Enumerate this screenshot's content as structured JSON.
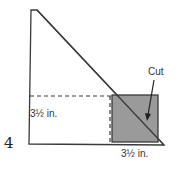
{
  "diagram": {
    "step_number": "4",
    "labels": {
      "left_measure": "3½ in.",
      "bottom_measure": "3½ in.",
      "cut": "Cut"
    },
    "colors": {
      "outline": "#3a3a3a",
      "cut_square_fill": "#9a9a9a",
      "background": "#ffffff"
    }
  }
}
